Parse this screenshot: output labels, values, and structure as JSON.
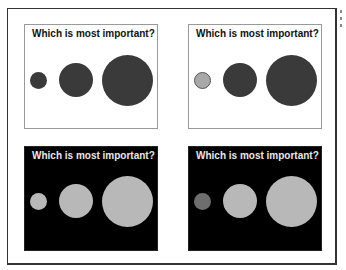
{
  "panels": [
    {
      "id": "top-left",
      "theme": "light",
      "title": "Which is most important?",
      "circles": [
        {
          "size": "small",
          "color": "#3a3a3a"
        },
        {
          "size": "medium",
          "color": "#3a3a3a"
        },
        {
          "size": "large",
          "color": "#3a3a3a"
        }
      ]
    },
    {
      "id": "top-right",
      "theme": "light",
      "title": "Which is most important?",
      "circles": [
        {
          "size": "small",
          "color": "#a8a8a8"
        },
        {
          "size": "medium",
          "color": "#3a3a3a"
        },
        {
          "size": "large",
          "color": "#3a3a3a"
        }
      ]
    },
    {
      "id": "bottom-left",
      "theme": "dark",
      "title": "Which is most important?",
      "circles": [
        {
          "size": "small",
          "color": "#b8b8b8"
        },
        {
          "size": "medium",
          "color": "#b8b8b8"
        },
        {
          "size": "large",
          "color": "#b8b8b8"
        }
      ]
    },
    {
      "id": "bottom-right",
      "theme": "dark",
      "title": "Which is most important?",
      "circles": [
        {
          "size": "small",
          "color": "#6e6e6e"
        },
        {
          "size": "medium",
          "color": "#b8b8b8"
        },
        {
          "size": "large",
          "color": "#b8b8b8"
        }
      ]
    }
  ]
}
